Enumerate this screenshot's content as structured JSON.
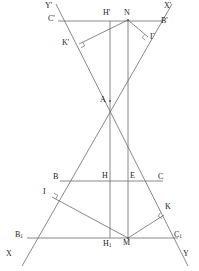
{
  "figure": {
    "stroke_color": "#6b6b6b",
    "label_color": "#1c1c1c",
    "background_color": "#ffffff",
    "width": 199,
    "height": 271,
    "points": [
      {
        "id": "Yprime",
        "label": "Y'",
        "x": 60,
        "y": 12,
        "lx": 45,
        "ly": 2,
        "sub": ""
      },
      {
        "id": "Xprime",
        "label": "X'",
        "x": 160,
        "y": 12,
        "lx": 164,
        "ly": 2,
        "sub": ""
      },
      {
        "id": "Cprime",
        "label": "C'",
        "x": 64,
        "y": 21,
        "lx": 48,
        "ly": 15,
        "sub": ""
      },
      {
        "id": "Bprime",
        "label": "B'",
        "x": 158,
        "y": 21,
        "lx": 161,
        "ly": 17,
        "sub": ""
      },
      {
        "id": "Hprime",
        "label": "H'",
        "x": 110,
        "y": 21,
        "lx": 103,
        "ly": 9,
        "sub": ""
      },
      {
        "id": "N",
        "label": "N",
        "x": 128,
        "y": 20,
        "lx": 124,
        "ly": 9,
        "sub": ""
      },
      {
        "id": "Kprime",
        "label": "K'",
        "x": 79,
        "y": 44,
        "lx": 62,
        "ly": 39,
        "sub": ""
      },
      {
        "id": "Gamma",
        "label": "Γ",
        "x": 148,
        "y": 37,
        "lx": 150,
        "ly": 33,
        "sub": ""
      },
      {
        "id": "A",
        "label": "A",
        "x": 110,
        "y": 101,
        "lx": 100,
        "ly": 96,
        "sub": ""
      },
      {
        "id": "B",
        "label": "B",
        "x": 64,
        "y": 181,
        "lx": 53,
        "ly": 173,
        "sub": ""
      },
      {
        "id": "H",
        "label": "H",
        "x": 110,
        "y": 181,
        "lx": 102,
        "ly": 172,
        "sub": ""
      },
      {
        "id": "E",
        "label": "E",
        "x": 128,
        "y": 181,
        "lx": 130,
        "ly": 172,
        "sub": ""
      },
      {
        "id": "C",
        "label": "C",
        "x": 158,
        "y": 181,
        "lx": 158,
        "ly": 173,
        "sub": ""
      },
      {
        "id": "I",
        "label": "I",
        "x": 52,
        "y": 197,
        "lx": 43,
        "ly": 188,
        "sub": ""
      },
      {
        "id": "K",
        "label": "K",
        "x": 164,
        "y": 215,
        "lx": 165,
        "ly": 203,
        "sub": ""
      },
      {
        "id": "B1",
        "label": "B",
        "x": 32,
        "y": 238,
        "lx": 15,
        "ly": 231,
        "sub": "1"
      },
      {
        "id": "C1",
        "label": "C",
        "x": 172,
        "y": 238,
        "lx": 174,
        "ly": 231,
        "sub": "1"
      },
      {
        "id": "H1",
        "label": "H",
        "x": 110,
        "y": 238,
        "lx": 103,
        "ly": 240,
        "sub": "1"
      },
      {
        "id": "M",
        "label": "M",
        "x": 128,
        "y": 238,
        "lx": 123,
        "ly": 239,
        "sub": ""
      },
      {
        "id": "X",
        "label": "X",
        "x": 22,
        "y": 254,
        "lx": 6,
        "ly": 250,
        "sub": ""
      },
      {
        "id": "Y",
        "label": "Y",
        "x": 180,
        "y": 254,
        "lx": 183,
        "ly": 250,
        "sub": ""
      }
    ],
    "segments": [
      {
        "id": "ray-X-Xprime",
        "name": "line-X-to-Xprime",
        "x1": 22,
        "y1": 266,
        "x2": 172,
        "y2": 4
      },
      {
        "id": "ray-Y-Yprime",
        "name": "line-Y-to-Yprime",
        "x1": 188,
        "y1": 266,
        "x2": 56,
        "y2": 4
      },
      {
        "id": "seg-Cprime-Bprime",
        "name": "segment-Cprime-Bprime",
        "x1": 58,
        "y1": 21,
        "x2": 163,
        "y2": 21
      },
      {
        "id": "seg-B-C",
        "name": "segment-B-C",
        "x1": 60,
        "y1": 181,
        "x2": 163,
        "y2": 181
      },
      {
        "id": "seg-B1-C1",
        "name": "segment-B1-C1",
        "x1": 27,
        "y1": 238,
        "x2": 178,
        "y2": 238
      },
      {
        "id": "vert-Hprime-H1",
        "name": "vertical-line-H",
        "x1": 110,
        "y1": 21,
        "x2": 110,
        "y2": 238
      },
      {
        "id": "vert-N-M",
        "name": "vertical-line-N-M",
        "x1": 128,
        "y1": 20,
        "x2": 128,
        "y2": 238
      },
      {
        "id": "seg-N-Kprime",
        "name": "segment-N-Kprime",
        "x1": 128,
        "y1": 20,
        "x2": 79,
        "y2": 44
      },
      {
        "id": "seg-N-Gamma",
        "name": "segment-N-Gamma",
        "x1": 128,
        "y1": 20,
        "x2": 148,
        "y2": 37
      },
      {
        "id": "seg-M-I",
        "name": "segment-M-I",
        "x1": 128,
        "y1": 238,
        "x2": 52,
        "y2": 197
      },
      {
        "id": "seg-M-K",
        "name": "segment-M-K",
        "x1": 128,
        "y1": 238,
        "x2": 164,
        "y2": 215
      }
    ],
    "right_angles": [
      {
        "id": "ra-Kprime",
        "name": "right-angle-marker-Kprime",
        "x": 79,
        "y": 44,
        "a1": -26,
        "a2": 64
      },
      {
        "id": "ra-Gamma",
        "name": "right-angle-marker-Gamma",
        "x": 148,
        "y": 37,
        "a1": 220,
        "a2": 130
      },
      {
        "id": "ra-I",
        "name": "right-angle-marker-I",
        "x": 52,
        "y": 197,
        "a1": 28,
        "a2": -62
      },
      {
        "id": "ra-K",
        "name": "right-angle-marker-K",
        "x": 164,
        "y": 215,
        "a1": 212,
        "a2": 122
      }
    ],
    "vertices_marked": [
      "A",
      "N",
      "M"
    ]
  }
}
